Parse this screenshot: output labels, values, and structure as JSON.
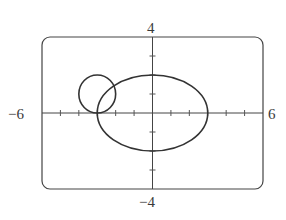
{
  "chart_data": {
    "type": "line",
    "title": "",
    "xlabel": "",
    "ylabel": "",
    "xlim": [
      -6,
      6
    ],
    "ylim": [
      -4,
      4
    ],
    "grid": false,
    "legend": null,
    "x_tick_marks": [
      -5,
      -4,
      -3,
      -2,
      -1,
      1,
      2,
      3,
      4,
      5
    ],
    "y_tick_marks": [
      -3,
      -2,
      -1,
      1,
      2,
      3
    ],
    "axis_labels": {
      "xmin": "−6",
      "xmax": "6",
      "ymax": "4",
      "ymin": "−4"
    },
    "series": [
      {
        "name": "ellipse",
        "shape": "ellipse",
        "equation": "x^2/9 + y^2/4 = 1",
        "center": [
          0,
          0
        ],
        "rx": 3,
        "ry": 2
      },
      {
        "name": "circle",
        "shape": "circle",
        "equation": "(x+3)^2 + (y-1)^2 = 1",
        "center": [
          -3,
          1
        ],
        "r": 1
      }
    ],
    "frame": {
      "rounded": true,
      "corner_radius_px": 8
    },
    "stroke_color": "#333333"
  }
}
